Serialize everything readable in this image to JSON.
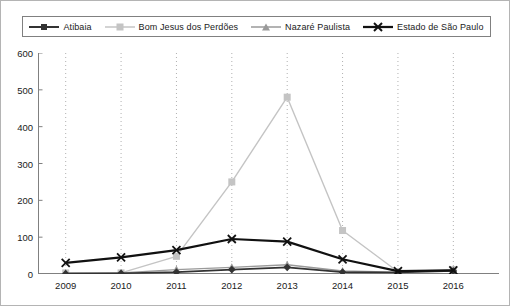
{
  "chart_data": {
    "type": "line",
    "title": "",
    "xlabel": "",
    "ylabel": "",
    "x": [
      2009,
      2010,
      2011,
      2012,
      2013,
      2014,
      2015,
      2016
    ],
    "categories": [
      "2009",
      "2010",
      "2011",
      "2012",
      "2013",
      "2014",
      "2015",
      "2016"
    ],
    "ylim": [
      0,
      600
    ],
    "yticks": [
      0,
      100,
      200,
      300,
      400,
      500,
      600
    ],
    "ytick_labels": [
      "0",
      "100",
      "200",
      "300",
      "400",
      "500",
      "600"
    ],
    "grid": "vertical-dotted",
    "legend_position": "top",
    "series": [
      {
        "name": "Atibaia",
        "marker": "diamond",
        "color": "#333333",
        "line_width": 1.6,
        "values": [
          1,
          2,
          5,
          12,
          18,
          5,
          4,
          8
        ]
      },
      {
        "name": "Bom Jesus dos Perdões",
        "marker": "square",
        "color": "#c4c4c4",
        "line_width": 1.4,
        "values": [
          3,
          3,
          48,
          250,
          480,
          118,
          6,
          12
        ]
      },
      {
        "name": "Nazaré Paulista",
        "marker": "triangle",
        "color": "#9a9a9a",
        "line_width": 1.4,
        "values": [
          2,
          3,
          12,
          18,
          25,
          8,
          5,
          10
        ]
      },
      {
        "name": "Estado de São Paulo",
        "marker": "cross",
        "color": "#111111",
        "line_width": 2.2,
        "values": [
          30,
          45,
          65,
          95,
          88,
          40,
          8,
          10
        ]
      }
    ]
  },
  "legend": {
    "items": [
      {
        "label": "Atibaia",
        "marker": "diamond-marker",
        "color": "#333333"
      },
      {
        "label": "Bom Jesus dos Perdões",
        "marker": "square-marker",
        "color": "#c4c4c4"
      },
      {
        "label": "Nazaré Paulista",
        "marker": "triangle-marker",
        "color": "#9a9a9a"
      },
      {
        "label": "Estado de São Paulo",
        "marker": "cross-marker",
        "color": "#111111"
      }
    ]
  },
  "axes": {
    "y_labels": [
      "600",
      "500",
      "400",
      "300",
      "200",
      "100",
      "0"
    ],
    "x_labels": [
      "2009",
      "2010",
      "2011",
      "2012",
      "2013",
      "2014",
      "2015",
      "2016"
    ]
  },
  "colors": {
    "frame": "#808080",
    "gridline": "#b0b0b0",
    "background": "#ffffff",
    "text": "#1a1a1a"
  }
}
